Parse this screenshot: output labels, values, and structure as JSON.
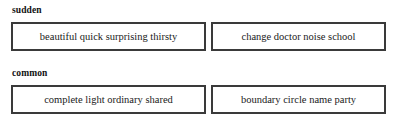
{
  "groups": [
    {
      "heading": "sudden",
      "boxes": [
        {
          "words_text": "beautiful  quick  surprising  thirsty",
          "words": [
            "beautiful",
            "quick",
            "surprising",
            "thirsty"
          ]
        },
        {
          "words_text": "change  doctor  noise  school",
          "words": [
            "change",
            "doctor",
            "noise",
            "school"
          ]
        }
      ]
    },
    {
      "heading": "common",
      "boxes": [
        {
          "words_text": "complete  light  ordinary  shared",
          "words": [
            "complete",
            "light",
            "ordinary",
            "shared"
          ]
        },
        {
          "words_text": "boundary  circle  name  party",
          "words": [
            "boundary",
            "circle",
            "name",
            "party"
          ]
        }
      ]
    }
  ],
  "colors": {
    "background": "#ffffff",
    "text": "#1a1a1a",
    "box_border": "#3a3a3a",
    "heading": "#111111"
  }
}
